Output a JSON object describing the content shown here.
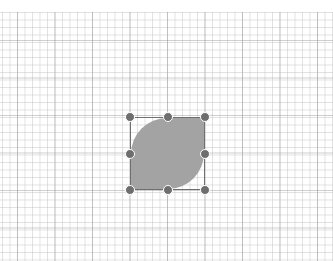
{
  "canvas": {
    "grid": {
      "minor_color": "#d8d8d8",
      "major_color": "#b4b4b4"
    },
    "shape": {
      "type": "leaf",
      "fill": "#a3a3a3",
      "selected": true
    },
    "selection": {
      "border_color": "#707070",
      "handle_color": "#6e6e6e",
      "handles": [
        "top-left",
        "top-middle",
        "top-right",
        "middle-left",
        "middle-right",
        "bottom-left",
        "bottom-middle",
        "bottom-right"
      ]
    }
  }
}
